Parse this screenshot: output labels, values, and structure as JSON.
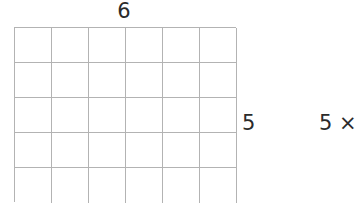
{
  "canvas": {
    "width": 356,
    "height": 207,
    "background_color": "#ffffff"
  },
  "grid": {
    "columns": 6,
    "rows": 5,
    "line_color": "#b3b3b3",
    "cell_width": 37,
    "cell_height": 35,
    "cropped_at_bottom": true
  },
  "labels": {
    "top_dimension": "6",
    "side_dimension": "5",
    "edge_expression": "5 ×"
  }
}
